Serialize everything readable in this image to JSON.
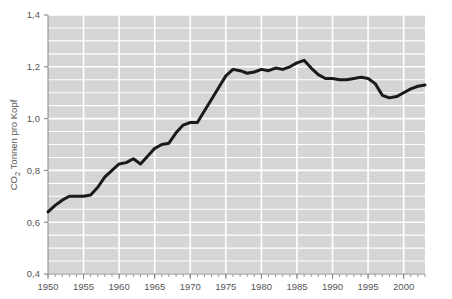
{
  "chart_data": {
    "type": "line",
    "title": "",
    "subtitle": "",
    "xlabel": "",
    "ylabel": "CO₂ Tonnen pro Kopf",
    "ylabel_parts": {
      "prefix": "CO",
      "subscript": "2",
      "suffix": " Tonnen pro Kopf"
    },
    "xlim": [
      1950,
      2003
    ],
    "ylim": [
      0.4,
      1.4
    ],
    "grid": true,
    "legend_position": "none",
    "x_tick_labels": [
      "1950",
      "1955",
      "1960",
      "1965",
      "1970",
      "1975",
      "1980",
      "1985",
      "1990",
      "1995",
      "2000"
    ],
    "x_tick_values": [
      1950,
      1955,
      1960,
      1965,
      1970,
      1975,
      1980,
      1985,
      1990,
      1995,
      2000
    ],
    "x_minor_tick_step": 1,
    "y_tick_labels": [
      "0,4",
      "0,6",
      "0,8",
      "1,0",
      "1,2",
      "1,4"
    ],
    "y_tick_values": [
      0.4,
      0.6,
      0.8,
      1.0,
      1.2,
      1.4
    ],
    "y_gridline_step": 0.05,
    "decimal_separator": ",",
    "series": [
      {
        "name": "CO2 pro Kopf",
        "color": "#1a1a1a",
        "line_width": 3,
        "x": [
          1950,
          1951,
          1952,
          1953,
          1954,
          1955,
          1956,
          1957,
          1958,
          1959,
          1960,
          1961,
          1962,
          1963,
          1964,
          1965,
          1966,
          1967,
          1968,
          1969,
          1970,
          1971,
          1972,
          1973,
          1974,
          1975,
          1976,
          1977,
          1978,
          1979,
          1980,
          1981,
          1982,
          1983,
          1984,
          1985,
          1986,
          1987,
          1988,
          1989,
          1990,
          1991,
          1992,
          1993,
          1994,
          1995,
          1996,
          1997,
          1998,
          1999,
          2000,
          2001,
          2002,
          2003
        ],
        "values": [
          0.64,
          0.665,
          0.685,
          0.7,
          0.7,
          0.7,
          0.705,
          0.735,
          0.775,
          0.8,
          0.825,
          0.83,
          0.845,
          0.825,
          0.855,
          0.885,
          0.9,
          0.905,
          0.945,
          0.975,
          0.985,
          0.985,
          1.03,
          1.075,
          1.12,
          1.165,
          1.19,
          1.185,
          1.175,
          1.18,
          1.19,
          1.185,
          1.195,
          1.19,
          1.2,
          1.215,
          1.225,
          1.195,
          1.17,
          1.155,
          1.155,
          1.15,
          1.15,
          1.155,
          1.16,
          1.155,
          1.135,
          1.09,
          1.08,
          1.085,
          1.1,
          1.115,
          1.125,
          1.13
        ]
      }
    ],
    "colors": {
      "plot_background": "#d5d5d5",
      "gridline": "#ffffff",
      "line": "#1a1a1a",
      "axis": "#808080",
      "text": "#555555",
      "page_background": "#ffffff"
    }
  }
}
